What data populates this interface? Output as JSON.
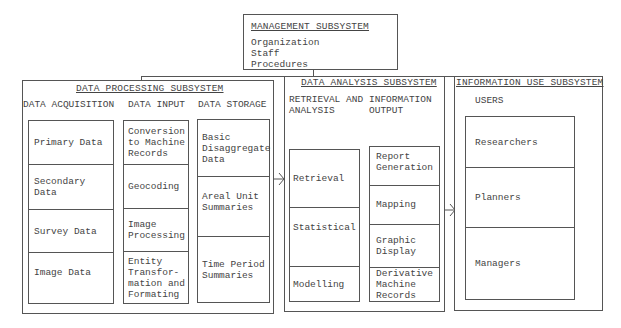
{
  "management": {
    "title": "MANAGEMENT SUBSYSTEM",
    "items": [
      "Organization",
      "Staff",
      "Procedures"
    ]
  },
  "data_processing": {
    "title": "DATA PROCESSING SUBSYSTEM",
    "columns": [
      {
        "header": "DATA ACQUISITION",
        "cells": [
          "Primary Data",
          "Secondary Data",
          "Survey Data",
          "Image Data"
        ]
      },
      {
        "header": "DATA INPUT",
        "cells": [
          "Conversion\nto Machine\nRecords",
          "Geocoding",
          "Image\nProcessing",
          "Entity\nTransfor-\nmation and\nFormating"
        ]
      },
      {
        "header": "DATA STORAGE",
        "cells": [
          "Basic\nDisaggregate\nData",
          "Areal Unit\nSummaries",
          "Time Period\nSummaries"
        ]
      }
    ]
  },
  "data_analysis": {
    "title": "DATA ANALYSIS SUBSYSTEM",
    "columns": [
      {
        "header": "RETRIEVAL AND\nANALYSIS",
        "cells": [
          "Retrieval",
          "Statistical",
          "Modelling"
        ]
      },
      {
        "header": "INFORMATION\nOUTPUT",
        "cells": [
          "Report\nGeneration",
          "Mapping",
          "Graphic\nDisplay",
          "Derivative\nMachine\nRecords"
        ]
      }
    ]
  },
  "information_use": {
    "title": "INFORMATION USE SUBSYSTEM",
    "columns": [
      {
        "header": "USERS",
        "cells": [
          "Researchers",
          "Planners",
          "Managers"
        ]
      }
    ]
  },
  "colors": {
    "line": "#555555",
    "text": "#444444",
    "background": "#ffffff"
  }
}
